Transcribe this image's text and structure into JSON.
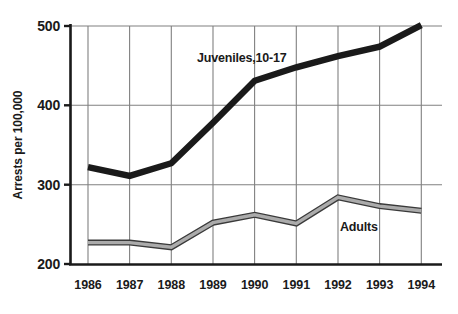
{
  "chart_data": {
    "type": "line",
    "title": "",
    "subtitle": "",
    "xlabel": "",
    "ylabel": "Arrests per 100,000",
    "categories": [
      "1986",
      "1987",
      "1988",
      "1989",
      "1990",
      "1991",
      "1992",
      "1993",
      "1994"
    ],
    "x": [
      1986,
      1987,
      1988,
      1989,
      1990,
      1991,
      1992,
      1993,
      1994
    ],
    "xlim": [
      1985.6,
      1994.5
    ],
    "ylim": [
      200,
      500
    ],
    "yticks": [
      200,
      300,
      400,
      500
    ],
    "ytick_labels": [
      "200",
      "300",
      "400",
      "500"
    ],
    "grid": true,
    "grid_axis": "both",
    "legend": "inline-annotation",
    "series": [
      {
        "name": "Juveniles,10-17",
        "annotation": "Juveniles,10-17",
        "style": "thick-black-line",
        "color": "#1a1a1a",
        "line_width": 6,
        "values": [
          322,
          311,
          327,
          378,
          431,
          448,
          462,
          474,
          501
        ]
      },
      {
        "name": "Adults",
        "annotation": "Adults",
        "style": "thin-gray-outlined-line",
        "color": "#8c8c8c",
        "outline_color": "#3a3a3a",
        "line_width": 5,
        "values": [
          227,
          227,
          221,
          252,
          262,
          251,
          284,
          273,
          267
        ]
      }
    ],
    "annotations": [
      {
        "text": "Juveniles,10-17",
        "x_px": 197,
        "y_px": 62
      },
      {
        "text": "Adults",
        "x_px": 340,
        "y_px": 230
      }
    ]
  },
  "axes": {
    "y_axis_title": "Arrests per 100,000",
    "y_tick_labels": [
      "500",
      "400",
      "300",
      "200"
    ],
    "x_tick_labels": [
      "1986",
      "1987",
      "1988",
      "1989",
      "1990",
      "1991",
      "1992",
      "1993",
      "1994"
    ]
  },
  "colors": {
    "background": "#ffffff",
    "axis": "#1a1a1a",
    "gridline": "#808080",
    "juveniles_line": "#1a1a1a",
    "adults_fill": "#9a9a9a",
    "adults_outline": "#3a3a3a",
    "text": "#1a1a1a"
  }
}
